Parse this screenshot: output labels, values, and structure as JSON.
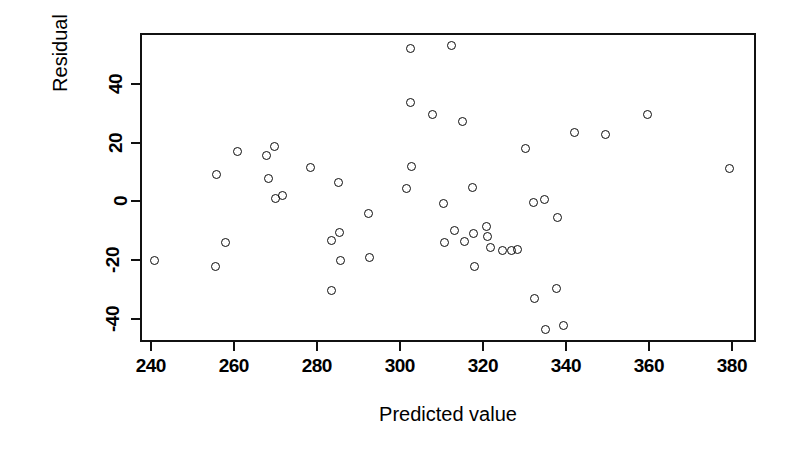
{
  "chart_data": {
    "type": "scatter",
    "title": "",
    "xlabel": "Predicted value",
    "ylabel": "Residual",
    "xticks": [
      240,
      260,
      280,
      300,
      320,
      340,
      360,
      380
    ],
    "yticks": [
      40,
      20,
      0,
      -20,
      -40
    ],
    "xticklabels": [
      "240",
      "260",
      "280",
      "300",
      "320",
      "340",
      "360",
      "380"
    ],
    "yticklabels": [
      "40",
      "20",
      "0",
      "-20",
      "-40"
    ],
    "xlim": [
      237.4,
      385.8
    ],
    "ylim": [
      -48.0,
      57.5
    ],
    "grid": false,
    "legend": null,
    "marker": "open-circle",
    "marker_color": "#0d0d0d",
    "points": [
      {
        "x": 240.4,
        "y": -19.6
      },
      {
        "x": 255.4,
        "y": 9.8
      },
      {
        "x": 255.2,
        "y": -21.5
      },
      {
        "x": 257.6,
        "y": -13.2
      },
      {
        "x": 260.4,
        "y": 17.8
      },
      {
        "x": 267.3,
        "y": 16.5
      },
      {
        "x": 267.9,
        "y": 8.4
      },
      {
        "x": 269.4,
        "y": 19.6
      },
      {
        "x": 269.6,
        "y": 1.6
      },
      {
        "x": 271.2,
        "y": 2.8
      },
      {
        "x": 278.0,
        "y": 12.4
      },
      {
        "x": 283.0,
        "y": -12.6
      },
      {
        "x": 283.1,
        "y": -29.9
      },
      {
        "x": 284.8,
        "y": 7.0
      },
      {
        "x": 285.0,
        "y": -9.8
      },
      {
        "x": 285.2,
        "y": -19.4
      },
      {
        "x": 292.0,
        "y": -3.6
      },
      {
        "x": 292.3,
        "y": -18.6
      },
      {
        "x": 301.1,
        "y": 5.0
      },
      {
        "x": 302.2,
        "y": 34.3
      },
      {
        "x": 302.4,
        "y": 12.5
      },
      {
        "x": 302.2,
        "y": 53.0
      },
      {
        "x": 307.4,
        "y": 30.2
      },
      {
        "x": 310.0,
        "y": 0.0
      },
      {
        "x": 310.2,
        "y": -13.3
      },
      {
        "x": 311.9,
        "y": 54.0
      },
      {
        "x": 312.6,
        "y": -9.2
      },
      {
        "x": 314.6,
        "y": 27.9
      },
      {
        "x": 315.2,
        "y": -12.9
      },
      {
        "x": 317.0,
        "y": 5.6
      },
      {
        "x": 317.3,
        "y": -10.2
      },
      {
        "x": 317.4,
        "y": -21.6
      },
      {
        "x": 320.4,
        "y": -8.0
      },
      {
        "x": 320.6,
        "y": -11.4
      },
      {
        "x": 321.4,
        "y": -15.2
      },
      {
        "x": 324.2,
        "y": -16.0
      },
      {
        "x": 326.4,
        "y": -16.0
      },
      {
        "x": 327.8,
        "y": -15.8
      },
      {
        "x": 329.8,
        "y": 18.8
      },
      {
        "x": 331.6,
        "y": 0.2
      },
      {
        "x": 332.0,
        "y": -32.4
      },
      {
        "x": 334.4,
        "y": 1.4
      },
      {
        "x": 334.5,
        "y": -43.0
      },
      {
        "x": 337.2,
        "y": -29.2
      },
      {
        "x": 337.4,
        "y": -4.8
      },
      {
        "x": 339.0,
        "y": -41.8
      },
      {
        "x": 341.6,
        "y": 24.2
      },
      {
        "x": 349.0,
        "y": 23.6
      },
      {
        "x": 359.2,
        "y": 30.2
      },
      {
        "x": 379.0,
        "y": 11.8
      }
    ]
  }
}
